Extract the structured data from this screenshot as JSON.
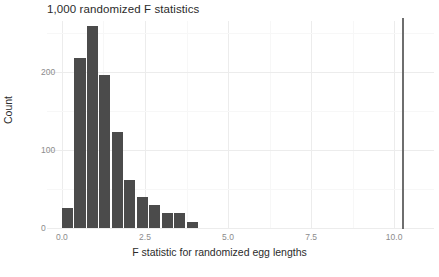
{
  "chart_data": {
    "type": "bar",
    "title": "1,000 randomized F statistics",
    "xlabel": "F statistic for randomized egg lengths",
    "ylabel": "Count",
    "xlim": [
      -0.45,
      11.2
    ],
    "ylim": [
      0,
      266
    ],
    "grid": true,
    "legend": null,
    "bin_width": 0.375,
    "categories": [
      "0.00",
      "0.38",
      "0.75",
      "1.12",
      "1.50",
      "1.88",
      "2.25",
      "2.62",
      "3.00",
      "3.38",
      "3.75"
    ],
    "bin_centers": [
      0.19,
      0.56,
      0.94,
      1.31,
      1.69,
      2.06,
      2.44,
      2.81,
      3.19,
      3.56,
      3.94
    ],
    "values": [
      26,
      218,
      259,
      196,
      124,
      62,
      40,
      30,
      19,
      19,
      8
    ],
    "annotations": [
      {
        "type": "vline",
        "label": "observed F statistic",
        "x": 10.25,
        "color": "#6e6e6e"
      }
    ],
    "xticks": [
      "0.0",
      "2.5",
      "5.0",
      "7.5",
      "10.0"
    ],
    "xtick_values": [
      0.0,
      2.5,
      5.0,
      7.5,
      10.0
    ],
    "yticks": [
      "0",
      "100",
      "200"
    ],
    "ytick_values": [
      0,
      100,
      200
    ],
    "bar_color": "#4b4b4b",
    "background_color": "#ffffff",
    "gridline_color": "#ececec"
  }
}
